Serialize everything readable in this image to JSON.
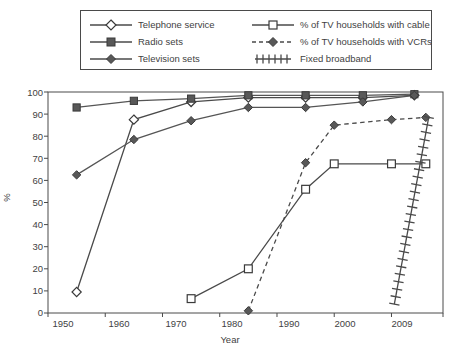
{
  "chart_data": {
    "type": "line",
    "title": "",
    "subtitle": "",
    "xlabel": "Year",
    "ylabel": "%",
    "xlim": [
      1945,
      2014
    ],
    "ylim": [
      0,
      100
    ],
    "grid": false,
    "legend_position": "top",
    "x_tick_labels": [
      "1950",
      "1960",
      "1970",
      "1980",
      "1990",
      "2000",
      "2009"
    ],
    "y_tick_labels": [
      "0",
      "10",
      "20",
      "30",
      "40",
      "50",
      "60",
      "70",
      "80",
      "90",
      "100"
    ],
    "y_ticks": [
      0,
      10,
      20,
      30,
      40,
      50,
      60,
      70,
      80,
      90,
      100
    ],
    "series": [
      {
        "name": "Telephone service",
        "marker": "open-diamond",
        "line": "solid",
        "color": "#4a4a4a",
        "x": [
          1950,
          1960,
          1970,
          1980,
          1990,
          2000,
          2009
        ],
        "values": [
          9.5,
          87.5,
          95.5,
          97.5,
          97.5,
          97.5,
          98.5
        ]
      },
      {
        "name": "Radio sets",
        "marker": "filled-square",
        "line": "solid",
        "color": "#555555",
        "x": [
          1950,
          1960,
          1970,
          1980,
          1990,
          2000,
          2009
        ],
        "values": [
          93,
          96,
          97,
          98.5,
          98.5,
          98.5,
          99
        ]
      },
      {
        "name": "Television sets",
        "marker": "filled-diamond",
        "line": "solid",
        "color": "#555555",
        "x": [
          1950,
          1960,
          1970,
          1980,
          1990,
          2000,
          2009
        ],
        "values": [
          62.5,
          78.5,
          87,
          93,
          93,
          95.5,
          98.5
        ]
      },
      {
        "name": "% of TV households with cable",
        "marker": "open-square",
        "line": "solid",
        "color": "#4a4a4a",
        "x": [
          1970,
          1980,
          1990,
          1995,
          2005,
          2011
        ],
        "values": [
          6.5,
          20,
          56,
          67.5,
          67.5,
          67.5
        ]
      },
      {
        "name": "% of TV households with VCRs",
        "marker": "filled-diamond",
        "line": "dashed",
        "color": "#4a4a4a",
        "x": [
          1980,
          1990,
          1995,
          2005,
          2011
        ],
        "values": [
          1,
          68,
          85,
          87.5,
          88.5
        ]
      },
      {
        "name": "Fixed broadband",
        "marker": "cross-hatch",
        "line": "hatched",
        "color": "#4a4a4a",
        "x": [
          2005.5,
          2011.5
        ],
        "values": [
          4,
          88.5
        ]
      }
    ]
  },
  "legend": {
    "items": [
      {
        "label": "Telephone service",
        "marker": "open-diamond",
        "line": "solid"
      },
      {
        "label": "Radio sets",
        "marker": "filled-square",
        "line": "solid"
      },
      {
        "label": "Television sets",
        "marker": "filled-diamond",
        "line": "solid"
      },
      {
        "label": "% of TV households with cable",
        "marker": "open-square",
        "line": "solid"
      },
      {
        "label": "% of TV households with VCRs",
        "marker": "filled-diamond",
        "line": "dashed"
      },
      {
        "label": "Fixed broadband",
        "marker": "cross-hatch",
        "line": "hatched"
      }
    ]
  },
  "colors": {
    "axis": "#4a4a4a",
    "text": "#3f3f3f",
    "series": "#4a4a4a",
    "background": "#ffffff"
  }
}
